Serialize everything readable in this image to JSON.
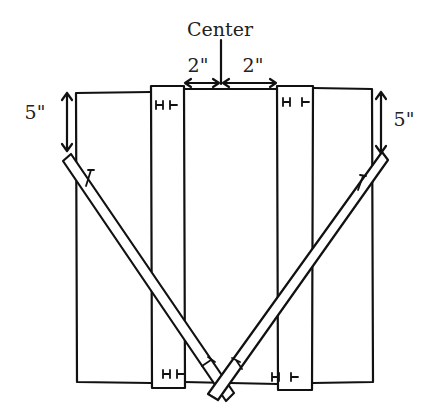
{
  "diagram": {
    "title_label": "Center",
    "dimensions": {
      "left_gap": "2\"",
      "right_gap": "2\"",
      "left_drop": "5\"",
      "right_drop": "5\""
    },
    "parts": [
      {
        "name": "outer-frame",
        "description": "rectangular panel"
      },
      {
        "name": "left-vertical-board",
        "marks_top": "H T",
        "marks_bottom": "H T"
      },
      {
        "name": "right-vertical-board",
        "marks_top": "H T",
        "marks_bottom": "H T"
      },
      {
        "name": "left-diagonal-board"
      },
      {
        "name": "right-diagonal-board"
      }
    ]
  }
}
